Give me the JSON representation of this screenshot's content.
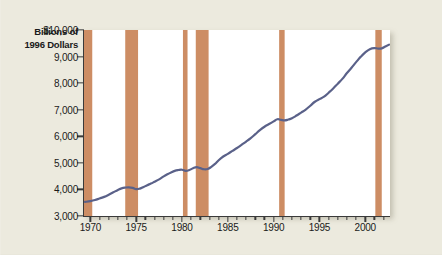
{
  "figure": {
    "background_color": "#eceade",
    "plot_background_color": "#ffffff",
    "line_color": "#5a6189",
    "band_color": "#cd8d64",
    "axis_color": "#3a3a3a"
  },
  "axis_title": {
    "line1": "Billions of",
    "line2": "1996 Dollars"
  },
  "chart_data": {
    "type": "line",
    "title": "",
    "subtitle": "",
    "xlabel": "",
    "ylabel": "Billions of 1996 Dollars",
    "xlim": [
      1969.3,
      2002.7
    ],
    "ylim": [
      3000,
      10000
    ],
    "grid": false,
    "legend": null,
    "yticks": [
      3000,
      4000,
      5000,
      6000,
      7000,
      8000,
      9000,
      10000
    ],
    "ytick_labels": [
      "3,000",
      "4,000",
      "5,000",
      "6,000",
      "7,000",
      "8,000",
      "9,000",
      "$10,000"
    ],
    "xticks": [
      1970,
      1975,
      1980,
      1985,
      1990,
      1995,
      2000
    ],
    "xtick_labels": [
      "1970",
      "1975",
      "1980",
      "1985",
      "1990",
      "1995",
      "2000"
    ],
    "xminor_step": 1,
    "series": [
      {
        "name": "Real GDP",
        "color": "#5a6189",
        "x": [
          1969.4,
          1970.0,
          1970.5,
          1971.0,
          1971.5,
          1972.0,
          1972.5,
          1973.0,
          1973.4,
          1973.8,
          1974.2,
          1974.6,
          1975.0,
          1975.4,
          1975.8,
          1976.2,
          1976.6,
          1977.0,
          1977.5,
          1978.0,
          1978.4,
          1978.8,
          1979.2,
          1979.6,
          1980.0,
          1980.4,
          1980.8,
          1981.2,
          1981.6,
          1982.0,
          1982.4,
          1982.8,
          1983.2,
          1983.6,
          1984.0,
          1984.5,
          1985.0,
          1985.5,
          1986.0,
          1986.5,
          1987.0,
          1987.5,
          1988.0,
          1988.5,
          1989.0,
          1989.5,
          1990.0,
          1990.4,
          1990.8,
          1991.2,
          1991.6,
          1992.0,
          1992.5,
          1993.0,
          1993.5,
          1994.0,
          1994.5,
          1995.0,
          1995.5,
          1996.0,
          1996.5,
          1997.0,
          1997.5,
          1998.0,
          1998.5,
          1999.0,
          1999.5,
          2000.0,
          2000.5,
          2001.0,
          2001.4,
          2001.8,
          2002.2,
          2002.6
        ],
        "y": [
          3530,
          3560,
          3600,
          3660,
          3720,
          3800,
          3890,
          3980,
          4040,
          4070,
          4080,
          4060,
          4010,
          4030,
          4090,
          4160,
          4220,
          4290,
          4380,
          4490,
          4570,
          4640,
          4700,
          4730,
          4740,
          4700,
          4730,
          4800,
          4840,
          4800,
          4760,
          4770,
          4850,
          4960,
          5100,
          5240,
          5340,
          5450,
          5560,
          5680,
          5800,
          5930,
          6080,
          6230,
          6360,
          6460,
          6560,
          6640,
          6620,
          6600,
          6630,
          6680,
          6780,
          6890,
          7000,
          7150,
          7300,
          7400,
          7490,
          7640,
          7800,
          7980,
          8160,
          8380,
          8580,
          8790,
          8990,
          9160,
          9280,
          9320,
          9300,
          9310,
          9380,
          9450
        ],
        "line_width": 2.2
      }
    ],
    "recession_bands": [
      {
        "label": "1969-1970 recession",
        "start": 1969.3,
        "end": 1970.2
      },
      {
        "label": "1973-1975 recession",
        "start": 1973.8,
        "end": 1975.2
      },
      {
        "label": "1980 recession",
        "start": 1980.1,
        "end": 1980.6
      },
      {
        "label": "1981-1982 recession",
        "start": 1981.5,
        "end": 1982.9
      },
      {
        "label": "1990-1991 recession",
        "start": 1990.6,
        "end": 1991.2
      },
      {
        "label": "2001 recession",
        "start": 2001.1,
        "end": 2001.8
      }
    ],
    "band_top_value": 10000,
    "band_bottom_value": 3000
  }
}
